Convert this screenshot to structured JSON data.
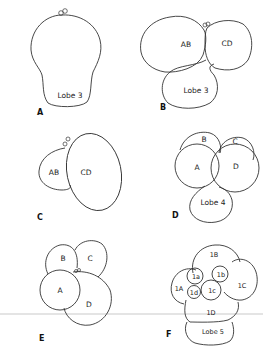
{
  "diagram": {
    "panels": [
      {
        "id": "A",
        "label": "A",
        "cells": [
          "Lobe 3"
        ]
      },
      {
        "id": "B",
        "label": "B",
        "cells": [
          "AB",
          "CD",
          "Lobe 3"
        ]
      },
      {
        "id": "C",
        "label": "C",
        "cells": [
          "AB",
          "CD"
        ]
      },
      {
        "id": "D",
        "label": "D",
        "cells": [
          "B",
          "C",
          "A",
          "D",
          "Lobe 4"
        ]
      },
      {
        "id": "E",
        "label": "E",
        "cells": [
          "B",
          "C",
          "A",
          "D"
        ]
      },
      {
        "id": "F",
        "label": "F",
        "cells": [
          "1B",
          "1a",
          "1b",
          "1C",
          "1A",
          "1d",
          "1c",
          "1D",
          "Lobe 5"
        ]
      }
    ],
    "colors": {
      "stroke": "#333333",
      "background": "#ffffff",
      "rule": "#bbbbbb"
    }
  }
}
